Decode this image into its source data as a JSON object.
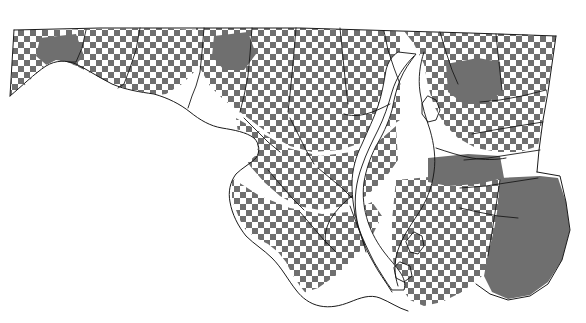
{
  "map": {
    "title": "Maryland",
    "region_name": "Maryland",
    "description": "Species distribution / thematic coverage map of the State of Maryland",
    "projection_note": "state outline with county boundaries and Chesapeake Bay",
    "legend": {
      "present_label": "Present",
      "absent_label": "Absent"
    },
    "colors": {
      "background": "#ffffff",
      "fill_gray": "#6f6f6f",
      "outline": "#111111",
      "county_line": "#1a1a1a",
      "water": "#ffffff"
    },
    "pattern": {
      "type": "checkerboard",
      "cell_size_px": 6,
      "fill_color": "#6f6f6f",
      "gap_color": "#ffffff"
    },
    "canvas": {
      "width": 586,
      "height": 323
    },
    "features": [
      {
        "name": "western-panhandle",
        "fill": "checker"
      },
      {
        "name": "central-maryland",
        "fill": "checker"
      },
      {
        "name": "southern-maryland",
        "fill": "checker"
      },
      {
        "name": "eastern-shore",
        "fill": "checker"
      },
      {
        "name": "worcester-county",
        "fill": "solid"
      },
      {
        "name": "chesapeake-bay",
        "fill": "water"
      },
      {
        "name": "potomac-river",
        "fill": "water"
      }
    ]
  }
}
